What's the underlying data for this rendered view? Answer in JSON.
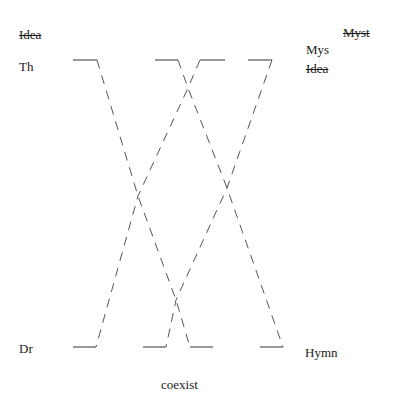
{
  "left_axis": {
    "header": "Idea",
    "header_struck": true,
    "top_label": "Th",
    "bottom_label": "Dr"
  },
  "right_axis": {
    "header": "Myst",
    "header_struck": true,
    "top_label": "Mys",
    "top_sublabel": "Idea",
    "top_sublabel_struck": true,
    "bottom_label": "Hymn"
  },
  "footer": {
    "caption": "coexist"
  },
  "diagram": {
    "style": "dashed crossing paths between top and bottom bars",
    "line_color": "#555555",
    "top_bars": [
      [
        73,
        97
      ],
      [
        155,
        178
      ],
      [
        200,
        225
      ],
      [
        248,
        272
      ]
    ],
    "bottom_bars": [
      [
        73,
        96
      ],
      [
        143,
        166
      ],
      [
        190,
        213
      ],
      [
        260,
        283
      ]
    ],
    "paths": [
      {
        "name": "path-1",
        "points": [
          [
            97,
            60
          ],
          [
            138,
            196
          ],
          [
            176,
            300
          ],
          [
            190,
            347
          ]
        ]
      },
      {
        "name": "path-2",
        "points": [
          [
            178,
            60
          ],
          [
            188,
            88
          ],
          [
            227,
            188
          ],
          [
            283,
            347
          ]
        ]
      },
      {
        "name": "path-3",
        "points": [
          [
            200,
            60
          ],
          [
            188,
            88
          ],
          [
            138,
            196
          ],
          [
            96,
            347
          ]
        ]
      },
      {
        "name": "path-4",
        "points": [
          [
            272,
            60
          ],
          [
            227,
            188
          ],
          [
            176,
            300
          ],
          [
            166,
            347
          ]
        ]
      }
    ]
  }
}
